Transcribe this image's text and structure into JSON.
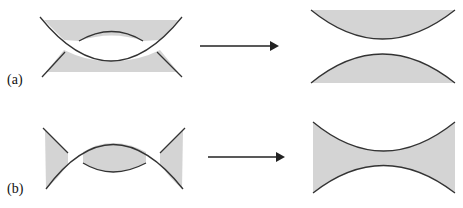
{
  "panels": [
    {
      "id": "a",
      "label": "(a)",
      "description": "Two crossing curved surfaces with gray bands transform into two separated convex shapes"
    },
    {
      "id": "b",
      "label": "(b)",
      "description": "Crossing arch with lens and side triangles transforms into a single hourglass neck shape"
    }
  ],
  "colors": {
    "fill": "#d4d4d4",
    "stroke": "#333333",
    "arrow": "#222222"
  }
}
